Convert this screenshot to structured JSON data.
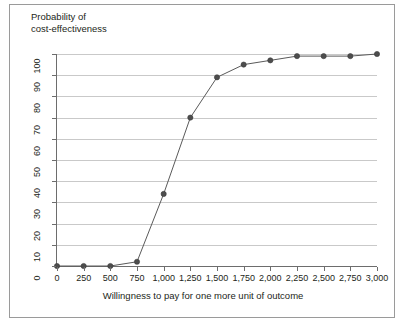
{
  "figure": {
    "y_axis_title": "Probability of\ncost-effectiveness",
    "x_axis_title": "Willingness to pay for one more unit of outcome"
  },
  "colors": {
    "line": "#5a5a5a",
    "marker": "#4d4d4d",
    "grid": "#c9c9c9",
    "axis": "#6d6d6d",
    "frame": "#9a9a9a",
    "text": "#231f20"
  },
  "chart_data": {
    "type": "line",
    "title": "",
    "subtitle": "",
    "xlabel": "Willingness to pay for one more unit of outcome",
    "ylabel": "Probability of cost-effectiveness",
    "x": [
      0,
      250,
      500,
      750,
      1000,
      1250,
      1500,
      1750,
      2000,
      2250,
      2500,
      2750,
      3000
    ],
    "xtick_labels": [
      "0",
      "250",
      "500",
      "750",
      "1,000",
      "1,250",
      "1,500",
      "1,750",
      "2,000",
      "2,250",
      "2,500",
      "2,750",
      "3,000"
    ],
    "values": [
      0,
      0,
      0,
      2,
      34,
      70,
      89,
      95,
      97,
      99,
      99,
      99,
      100
    ],
    "ytick_labels": [
      "0",
      "10",
      "20",
      "30",
      "40",
      "50",
      "60",
      "70",
      "80",
      "90",
      "100"
    ],
    "yticks": [
      0,
      10,
      20,
      30,
      40,
      50,
      60,
      70,
      80,
      90,
      100
    ],
    "xlim": [
      0,
      3000
    ],
    "ylim": [
      0,
      100
    ],
    "grid": true,
    "grid_axis": "y",
    "legend": false,
    "legend_position": "none",
    "markers": true,
    "series": [
      {
        "name": "Probability of cost-effectiveness",
        "values": [
          0,
          0,
          0,
          2,
          34,
          70,
          89,
          95,
          97,
          99,
          99,
          99,
          100
        ]
      }
    ]
  }
}
